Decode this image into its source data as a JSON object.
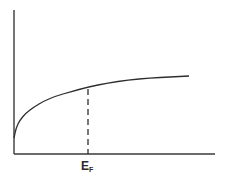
{
  "chart_data": {
    "type": "line",
    "title": "",
    "xlabel": "",
    "ylabel": "",
    "grid": false,
    "legend": null,
    "axis_ticks": {
      "x": [],
      "y": []
    },
    "series": [
      {
        "name": "curve",
        "shape": "sqrt-like rise, concave down, saturating",
        "points_px": [
          [
            14,
            138
          ],
          [
            16,
            128
          ],
          [
            20,
            120
          ],
          [
            26,
            113
          ],
          [
            34,
            107
          ],
          [
            44,
            101
          ],
          [
            56,
            96
          ],
          [
            70,
            92
          ],
          [
            88,
            87
          ],
          [
            108,
            83
          ],
          [
            128,
            80
          ],
          [
            150,
            78
          ],
          [
            170,
            77
          ],
          [
            189,
            76
          ]
        ]
      }
    ],
    "annotations": [
      {
        "type": "dashed-vertical-line",
        "x_px": 88,
        "from_y_px": 89,
        "to_y_px": 154,
        "label": "E",
        "label_subscript": "F"
      }
    ],
    "axes_px": {
      "origin": [
        14,
        154
      ],
      "y_top": 10,
      "x_right": 215
    }
  },
  "labels": {
    "fermi_main": "E",
    "fermi_sub": "F"
  }
}
